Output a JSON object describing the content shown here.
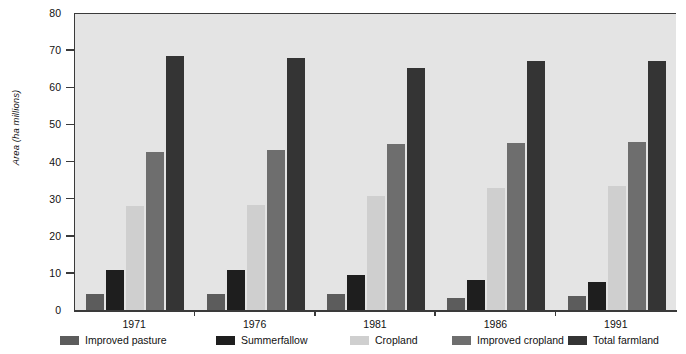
{
  "chart_data": {
    "type": "bar",
    "title": "",
    "xlabel": "",
    "ylabel": "Area (ha millions)",
    "categories": [
      "1971",
      "1976",
      "1981",
      "1986",
      "1991"
    ],
    "ylim": [
      0,
      80
    ],
    "yticks": [
      0,
      10,
      20,
      30,
      40,
      50,
      60,
      70,
      80
    ],
    "grid": false,
    "legend_position": "bottom",
    "series": [
      {
        "name": "Improved pasture",
        "color": "#5c5c5c",
        "values": [
          4.3,
          4.2,
          4.2,
          3.3,
          3.7
        ]
      },
      {
        "name": "Summerfallow",
        "color": "#1e1e1e",
        "values": [
          10.8,
          10.8,
          9.4,
          8.1,
          7.5
        ]
      },
      {
        "name": "Cropland",
        "color": "#cfcfcf",
        "values": [
          28.0,
          28.2,
          30.8,
          33.0,
          33.3
        ]
      },
      {
        "name": "Improved cropland",
        "color": "#6e6e6e",
        "values": [
          42.5,
          43.0,
          44.7,
          45.0,
          45.2
        ]
      },
      {
        "name": "Total farmland",
        "color": "#343434",
        "values": [
          68.5,
          68.0,
          65.3,
          67.2,
          67.0
        ]
      }
    ]
  }
}
